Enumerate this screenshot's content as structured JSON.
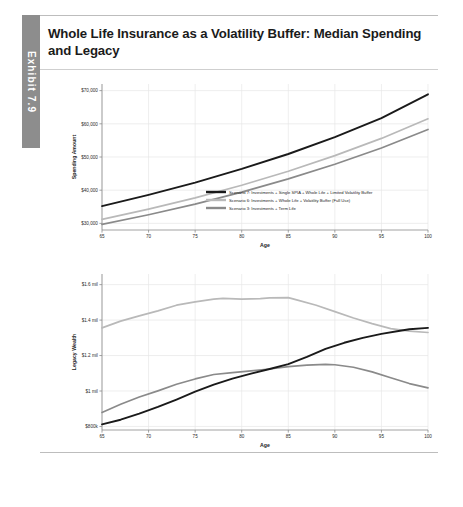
{
  "exhibit": {
    "tab_label": "Exhibit 7.9"
  },
  "title": "Whole Life Insurance as a Volatility Buffer: Median Spending and Legacy",
  "legend": {
    "items": [
      {
        "label": "Scenario 7: Investments + Single SPIA + Whole Life + Limited Volatility Buffer",
        "color": "#1a1a1a"
      },
      {
        "label": "Scenario 6: Investments + Whole Life + Volatility Buffer (Full Use)",
        "color": "#b9b9b9"
      },
      {
        "label": "Scenario 3: Investments + Term Life",
        "color": "#8a8a8a"
      }
    ]
  },
  "chart_data": [
    {
      "type": "line",
      "id": "spending",
      "title": "",
      "xlabel": "Age",
      "ylabel": "Spending Amount",
      "x": [
        65,
        70,
        75,
        80,
        85,
        90,
        95,
        100
      ],
      "xticks": [
        "65",
        "70",
        "75",
        "80",
        "85",
        "90",
        "95",
        "100"
      ],
      "xlim": [
        65,
        100
      ],
      "ylim": [
        28000,
        72000
      ],
      "yticks": [
        30000,
        40000,
        50000,
        60000,
        70000
      ],
      "ytick_labels": [
        "$30,000",
        "$40,000",
        "$50,000",
        "$60,000",
        "$70,000"
      ],
      "grid": true,
      "legend_position": "inside-bottom-right",
      "series": [
        {
          "name": "Scenario 7: Investments + Single SPIA + Whole Life + Limited Volatility Buffer",
          "color": "#1a1a1a",
          "width": 1.9,
          "values": [
            35200,
            38600,
            42300,
            46400,
            50900,
            56000,
            61700,
            68900
          ]
        },
        {
          "name": "Scenario 6: Investments + Whole Life + Volatility Buffer (Full Use)",
          "color": "#b9b9b9",
          "width": 1.7,
          "values": [
            31200,
            34300,
            37700,
            41500,
            45700,
            50400,
            55600,
            61500
          ]
        },
        {
          "name": "Scenario 3: Investments + Term Life",
          "color": "#8a8a8a",
          "width": 1.7,
          "values": [
            29700,
            32600,
            35800,
            39400,
            43400,
            47800,
            52700,
            58300
          ]
        }
      ]
    },
    {
      "type": "line",
      "id": "legacy",
      "title": "",
      "xlabel": "Age",
      "ylabel": "Legacy Wealth",
      "x": [
        65,
        70,
        75,
        80,
        85,
        90,
        95,
        100
      ],
      "xticks": [
        "65",
        "70",
        "75",
        "80",
        "85",
        "90",
        "95",
        "100"
      ],
      "xlim": [
        65,
        100
      ],
      "ylim": [
        780000,
        1660000
      ],
      "yticks": [
        800000,
        1000000,
        1200000,
        1400000,
        1600000
      ],
      "ytick_labels": [
        "$800k",
        "$1 mil",
        "$1.2 mil",
        "$1.4 mil",
        "$1.6 mil"
      ],
      "grid": true,
      "legend_position": "none",
      "series": [
        {
          "name": "Scenario 6: Investments + Whole Life + Volatility Buffer (Full Use)",
          "color": "#b9b9b9",
          "width": 1.7,
          "points": [
            [
              65,
              1356000
            ],
            [
              67,
              1394000
            ],
            [
              69,
              1424000
            ],
            [
              71,
              1452000
            ],
            [
              73,
              1484000
            ],
            [
              75,
              1503000
            ],
            [
              77,
              1518000
            ],
            [
              78,
              1523000
            ],
            [
              80,
              1518000
            ],
            [
              82,
              1521000
            ],
            [
              83,
              1525000
            ],
            [
              85,
              1527000
            ],
            [
              86,
              1513000
            ],
            [
              88,
              1484000
            ],
            [
              90,
              1448000
            ],
            [
              92,
              1412000
            ],
            [
              94,
              1380000
            ],
            [
              96,
              1352000
            ],
            [
              98,
              1338000
            ],
            [
              100,
              1330000
            ]
          ]
        },
        {
          "name": "Scenario 3: Investments + Term Life",
          "color": "#8a8a8a",
          "width": 1.7,
          "points": [
            [
              65,
              879000
            ],
            [
              67,
              925000
            ],
            [
              69,
              966000
            ],
            [
              71,
              1001000
            ],
            [
              73,
              1038000
            ],
            [
              75,
              1068000
            ],
            [
              77,
              1093000
            ],
            [
              79,
              1104000
            ],
            [
              81,
              1113000
            ],
            [
              83,
              1124000
            ],
            [
              85,
              1138000
            ],
            [
              87,
              1146000
            ],
            [
              89,
              1150000
            ],
            [
              90,
              1148000
            ],
            [
              92,
              1134000
            ],
            [
              94,
              1108000
            ],
            [
              96,
              1075000
            ],
            [
              98,
              1042000
            ],
            [
              100,
              1018000
            ]
          ]
        },
        {
          "name": "Scenario 7: Investments + Single SPIA + Whole Life + Limited Volatility Buffer",
          "color": "#1a1a1a",
          "width": 1.9,
          "points": [
            [
              65,
              812000
            ],
            [
              67,
              838000
            ],
            [
              69,
              872000
            ],
            [
              71,
              910000
            ],
            [
              73,
              952000
            ],
            [
              75,
              996000
            ],
            [
              77,
              1036000
            ],
            [
              79,
              1070000
            ],
            [
              81,
              1098000
            ],
            [
              83,
              1124000
            ],
            [
              85,
              1152000
            ],
            [
              87,
              1192000
            ],
            [
              89,
              1238000
            ],
            [
              91,
              1272000
            ],
            [
              93,
              1300000
            ],
            [
              95,
              1322000
            ],
            [
              97,
              1340000
            ],
            [
              98,
              1348000
            ],
            [
              100,
              1356000
            ]
          ]
        }
      ]
    }
  ]
}
